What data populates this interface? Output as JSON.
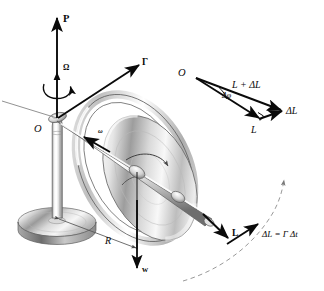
{
  "figure": {
    "background_color": "#ffffff",
    "ink_color": "#0a0a0a",
    "metal_light": "#fdfdfd",
    "metal_mid": "#c9c9c9",
    "metal_dark": "#6f6f6f"
  },
  "labels": {
    "precession_vector": "P",
    "precession_rate": "Ω",
    "torque_vector": "Γ",
    "spin_rate": "ω",
    "origin_main": "O",
    "radius": "R",
    "weight": "w",
    "angular_momentum": "L",
    "delta_L_arc": "ΔL = Γ Δt"
  },
  "vector_triangle": {
    "origin": "O",
    "hypotenuse": "L + ΔL",
    "base": "L",
    "delta": "ΔL",
    "angle": "Δφ",
    "right_angle_marker": "∟"
  },
  "components": {
    "pedestal_base": "pedestal-base",
    "pedestal_column": "pedestal-column",
    "pivot": "pivot-point",
    "gimbal_ring": "gimbal-ring",
    "flywheel_disk": "flywheel-disk",
    "axle_rod": "axle-rod",
    "precession_arc": "precession-dashed-arc",
    "spin_arrow": "disk-spin-arrow",
    "precession_curl": "precession-curl-arrow"
  }
}
